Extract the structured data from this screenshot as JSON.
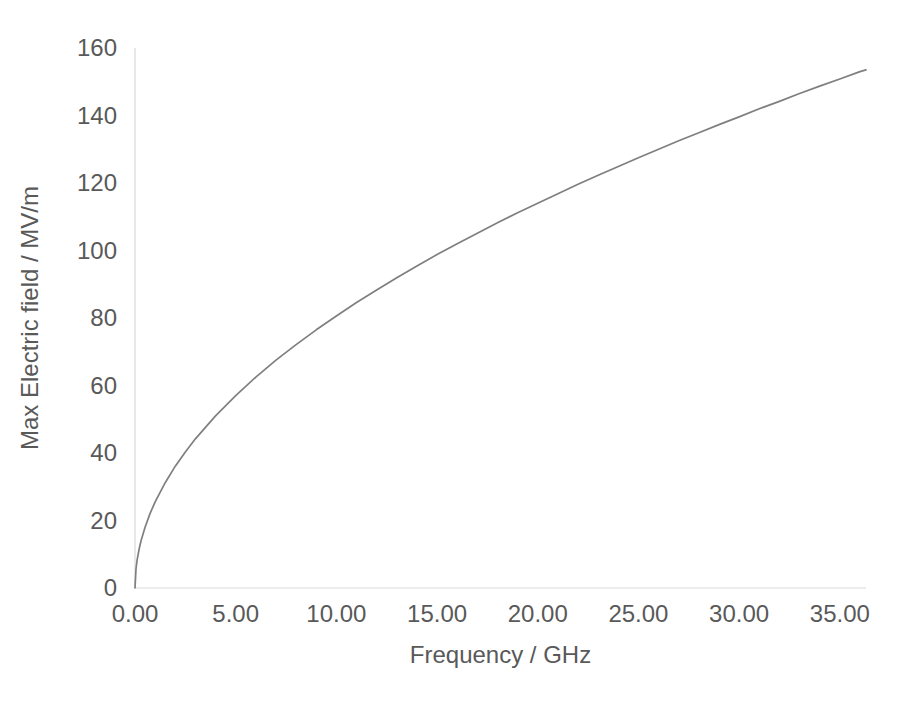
{
  "chart_data": {
    "type": "line",
    "title": "",
    "subtitle": "",
    "xlabel": "Frequency / GHz",
    "ylabel": "Max Electric field / MV/m",
    "xlim": [
      0,
      36.3
    ],
    "ylim": [
      0,
      160
    ],
    "grid": false,
    "legend": null,
    "legend_position": "none",
    "x_ticks": [
      0,
      5,
      10,
      15,
      20,
      25,
      30,
      35
    ],
    "x_tick_labels": [
      "0.00",
      "5.00",
      "10.00",
      "15.00",
      "20.00",
      "25.00",
      "30.00",
      "35.00"
    ],
    "y_ticks": [
      0,
      20,
      40,
      60,
      80,
      100,
      120,
      140,
      160
    ],
    "y_tick_labels": [
      "0",
      "20",
      "40",
      "60",
      "80",
      "100",
      "120",
      "140",
      "160"
    ],
    "series": [
      {
        "name": "Max Electric field",
        "color": "#7f7f7f",
        "x": [
          0,
          0.05,
          0.1,
          0.2,
          0.3,
          0.5,
          0.75,
          1,
          1.5,
          2,
          2.5,
          3,
          4,
          5,
          6,
          7,
          8,
          9,
          10,
          11,
          12,
          13,
          14,
          15,
          16,
          17,
          18,
          19,
          20,
          21,
          22,
          23,
          24,
          25,
          26,
          27,
          28,
          29,
          30,
          31,
          32,
          33,
          34,
          35,
          36,
          36.3
        ],
        "values": [
          0,
          5.7,
          8.1,
          11.4,
          14.0,
          18.0,
          22.1,
          25.5,
          31.2,
          36.1,
          40.3,
          44.2,
          51.0,
          57.0,
          62.5,
          67.5,
          72.1,
          76.5,
          80.6,
          84.6,
          88.3,
          91.9,
          95.4,
          98.8,
          102.0,
          105.1,
          108.2,
          111.2,
          114.0,
          116.8,
          119.6,
          122.3,
          124.9,
          127.5,
          130.0,
          132.5,
          134.9,
          137.3,
          139.6,
          142.0,
          144.2,
          146.5,
          148.7,
          150.8,
          153.0,
          153.5
        ]
      }
    ],
    "annotations": []
  },
  "axis_titles": {
    "x": "Frequency / GHz",
    "y": "Max Electric field / MV/m"
  },
  "colors": {
    "series": "#7f7f7f",
    "axis": "#d9d9d9",
    "text": "#595959",
    "background": "#ffffff"
  }
}
